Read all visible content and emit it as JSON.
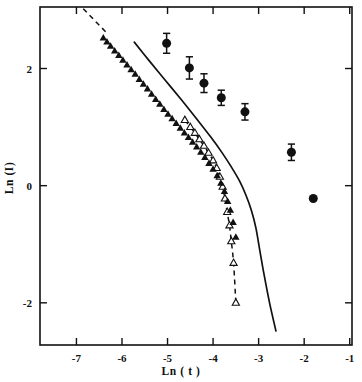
{
  "chart_data": {
    "type": "scatter",
    "title": "",
    "xlabel": "Ln ( t )",
    "ylabel": "Ln (I)",
    "xlim": [
      -7.8,
      -0.95
    ],
    "ylim": [
      -2.72,
      3.05
    ],
    "xticks": [
      -7,
      -6,
      -5,
      -4,
      -3,
      -2,
      -1
    ],
    "xticklabels": [
      "-7",
      "-6",
      "-5",
      "-4",
      "-3",
      "-2",
      "-1"
    ],
    "yticks": [
      2,
      0,
      -2
    ],
    "yticklabels": [
      "2",
      "0",
      "-2"
    ],
    "grid": false,
    "legend": "none",
    "series": [
      {
        "name": "filled-circles-with-error-bars",
        "marker": "filled-circle",
        "has_error_bars": true,
        "points": [
          {
            "x": -5.02,
            "y": 2.43,
            "yerr": 0.17
          },
          {
            "x": -4.52,
            "y": 2.01,
            "yerr": 0.19
          },
          {
            "x": -4.2,
            "y": 1.75,
            "yerr": 0.16
          },
          {
            "x": -3.82,
            "y": 1.5,
            "yerr": 0.13
          },
          {
            "x": -3.3,
            "y": 1.26,
            "yerr": 0.14
          },
          {
            "x": -2.28,
            "y": 0.57,
            "yerr": 0.14
          },
          {
            "x": -1.8,
            "y": -0.22,
            "yerr": 0.0
          }
        ]
      },
      {
        "name": "filled-triangles",
        "marker": "filled-triangle",
        "has_error_bars": false,
        "points": [
          {
            "x": -6.41,
            "y": 2.52
          },
          {
            "x": -6.33,
            "y": 2.45
          },
          {
            "x": -6.25,
            "y": 2.38
          },
          {
            "x": -6.16,
            "y": 2.3
          },
          {
            "x": -6.07,
            "y": 2.22
          },
          {
            "x": -5.98,
            "y": 2.14
          },
          {
            "x": -5.89,
            "y": 2.06
          },
          {
            "x": -5.8,
            "y": 1.98
          },
          {
            "x": -5.71,
            "y": 1.9
          },
          {
            "x": -5.62,
            "y": 1.81
          },
          {
            "x": -5.53,
            "y": 1.73
          },
          {
            "x": -5.44,
            "y": 1.65
          },
          {
            "x": -5.35,
            "y": 1.56
          },
          {
            "x": -5.26,
            "y": 1.47
          },
          {
            "x": -5.17,
            "y": 1.39
          },
          {
            "x": -5.08,
            "y": 1.3
          },
          {
            "x": -4.99,
            "y": 1.22
          },
          {
            "x": -4.9,
            "y": 1.14
          },
          {
            "x": -4.81,
            "y": 1.06
          },
          {
            "x": -4.72,
            "y": 0.98
          },
          {
            "x": -4.63,
            "y": 0.9
          },
          {
            "x": -4.54,
            "y": 0.82
          },
          {
            "x": -4.45,
            "y": 0.74
          },
          {
            "x": -4.36,
            "y": 0.66
          },
          {
            "x": -4.27,
            "y": 0.57
          },
          {
            "x": -4.18,
            "y": 0.48
          },
          {
            "x": -4.09,
            "y": 0.38
          },
          {
            "x": -4.0,
            "y": 0.28
          },
          {
            "x": -3.91,
            "y": 0.17
          },
          {
            "x": -3.83,
            "y": 0.04
          },
          {
            "x": -3.75,
            "y": -0.1
          },
          {
            "x": -3.68,
            "y": -0.27
          },
          {
            "x": -3.62,
            "y": -0.42
          },
          {
            "x": -3.56,
            "y": -0.63
          },
          {
            "x": -3.5,
            "y": -0.88
          }
        ]
      },
      {
        "name": "open-triangles-dashed",
        "marker": "open-triangle",
        "has_error_bars": false,
        "connected_by": "dashed-line",
        "points": [
          {
            "x": -4.62,
            "y": 1.12
          },
          {
            "x": -4.5,
            "y": 1.0
          },
          {
            "x": -4.4,
            "y": 0.9
          },
          {
            "x": -4.3,
            "y": 0.79
          },
          {
            "x": -4.2,
            "y": 0.68
          },
          {
            "x": -4.1,
            "y": 0.56
          },
          {
            "x": -4.0,
            "y": 0.43
          },
          {
            "x": -3.92,
            "y": 0.3
          },
          {
            "x": -3.85,
            "y": 0.15
          },
          {
            "x": -3.79,
            "y": -0.02
          },
          {
            "x": -3.74,
            "y": -0.22
          },
          {
            "x": -3.69,
            "y": -0.45
          },
          {
            "x": -3.64,
            "y": -0.68
          },
          {
            "x": -3.6,
            "y": -0.95
          },
          {
            "x": -3.55,
            "y": -1.32
          },
          {
            "x": -3.5,
            "y": -2.0
          }
        ],
        "dash_extension_start": {
          "x": -6.85,
          "y": 3.02
        },
        "dash_extension_end": {
          "x": -6.3,
          "y": 2.58
        }
      },
      {
        "name": "solid-theory-curve",
        "marker": "none",
        "line": "solid",
        "points": [
          {
            "x": -5.73,
            "y": 2.45
          },
          {
            "x": -5.4,
            "y": 2.13
          },
          {
            "x": -5.05,
            "y": 1.8
          },
          {
            "x": -4.7,
            "y": 1.47
          },
          {
            "x": -4.35,
            "y": 1.13
          },
          {
            "x": -4.05,
            "y": 0.83
          },
          {
            "x": -3.8,
            "y": 0.56
          },
          {
            "x": -3.6,
            "y": 0.32
          },
          {
            "x": -3.42,
            "y": 0.08
          },
          {
            "x": -3.28,
            "y": -0.16
          },
          {
            "x": -3.16,
            "y": -0.42
          },
          {
            "x": -3.06,
            "y": -0.72
          },
          {
            "x": -2.98,
            "y": -1.08
          },
          {
            "x": -2.88,
            "y": -1.52
          },
          {
            "x": -2.76,
            "y": -2.0
          },
          {
            "x": -2.62,
            "y": -2.48
          }
        ]
      }
    ]
  }
}
